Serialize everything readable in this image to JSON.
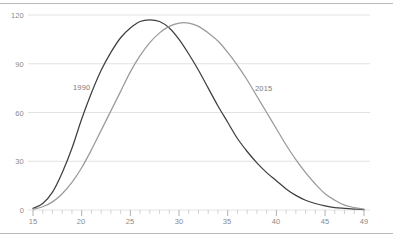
{
  "chart_data": {
    "type": "line",
    "title": "",
    "subtitle": "",
    "xlabel": "",
    "ylabel": "",
    "xlim": [
      15,
      49
    ],
    "ylim": [
      0,
      120
    ],
    "grid": true,
    "gridlines_y": [
      0,
      30,
      60,
      90,
      120
    ],
    "legend_position": "inline-annotations",
    "x_ticks_major": [
      15,
      20,
      25,
      30,
      35,
      40,
      45,
      49
    ],
    "x_tick_labels": [
      "15",
      "20",
      "25",
      "30",
      "35",
      "40",
      "45",
      "49"
    ],
    "x_ticks_minor_step": 1,
    "y_ticks": [
      0,
      30,
      60,
      90,
      120
    ],
    "y_tick_labels": [
      "0",
      "30",
      "60",
      "90",
      "120"
    ],
    "x": [
      15,
      16,
      17,
      18,
      19,
      20,
      21,
      22,
      23,
      24,
      25,
      26,
      27,
      28,
      29,
      30,
      31,
      32,
      33,
      34,
      35,
      36,
      37,
      38,
      39,
      40,
      41,
      42,
      43,
      44,
      45,
      46,
      47,
      48,
      49
    ],
    "series": [
      {
        "name": "1990",
        "color": "#3f3f3f",
        "label_x": 21.2,
        "label_y": 73,
        "values": [
          1,
          4,
          11,
          23,
          38,
          56,
          72,
          86,
          97,
          106,
          112,
          116,
          117,
          116,
          112,
          105,
          96,
          86,
          75,
          64,
          54,
          44,
          36,
          29,
          23,
          18,
          13,
          9,
          6,
          4,
          2.5,
          1.5,
          1,
          0.6,
          0.3
        ]
      },
      {
        "name": "2015",
        "color": "#9a9a9a",
        "label_x": 38.5,
        "label_y": 70,
        "values": [
          0.5,
          2,
          5,
          10,
          17,
          26,
          37,
          49,
          61,
          73,
          85,
          95,
          103,
          109,
          113,
          115,
          115,
          113,
          109,
          104,
          97,
          89,
          80,
          70,
          60,
          50,
          40,
          31,
          23,
          16,
          10,
          6,
          3,
          1.5,
          0.5
        ]
      }
    ]
  },
  "axis": {
    "y_labels": [
      "120",
      "90",
      "60",
      "30",
      "0"
    ],
    "x_labels": [
      "15",
      "20",
      "25",
      "30",
      "35",
      "40",
      "45",
      "49"
    ]
  },
  "annotations": {
    "series_1990": "1990",
    "series_2015": "2015"
  },
  "colors": {
    "series_1990": "#3f3f3f",
    "series_2015": "#9a9a9a",
    "gridline": "#e2e2e2",
    "axis_text": "#8a8a8a",
    "frame": "#b9b9b9"
  }
}
